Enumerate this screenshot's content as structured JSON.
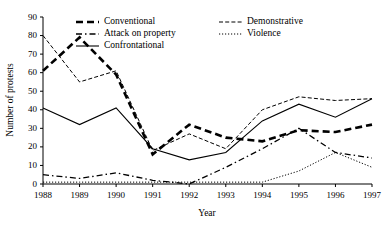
{
  "chart_data": {
    "type": "line",
    "title": "",
    "xlabel": "Year",
    "ylabel": "Number of protests",
    "categories": [
      "1988",
      "1989",
      "1990",
      "1991",
      "1992",
      "1993",
      "1994",
      "1995",
      "1996",
      "1997"
    ],
    "x": [
      1988,
      1989,
      1990,
      1991,
      1992,
      1993,
      1994,
      1995,
      1996,
      1997
    ],
    "xlim": [
      1988,
      1997
    ],
    "ylim": [
      0,
      90
    ],
    "yticks": [
      0,
      10,
      20,
      30,
      40,
      50,
      60,
      70,
      80,
      90
    ],
    "grid": false,
    "legend_position": "top-inside",
    "series": [
      {
        "name": "Conventional",
        "values": [
          61,
          79,
          59,
          16,
          32,
          25,
          23,
          29,
          28,
          32
        ]
      },
      {
        "name": "Attack on property",
        "values": [
          5,
          3,
          6,
          2,
          0,
          9,
          19,
          30,
          17,
          14
        ]
      },
      {
        "name": "Confrontational",
        "values": [
          41,
          32,
          41,
          19,
          13,
          17,
          34,
          43,
          36,
          46
        ]
      },
      {
        "name": "Demonstrative",
        "values": [
          80,
          55,
          61,
          18,
          27,
          19,
          40,
          47,
          45,
          46
        ]
      },
      {
        "name": "Violence",
        "values": [
          1,
          1,
          1,
          1,
          1,
          1,
          1,
          7,
          17,
          9
        ]
      }
    ]
  },
  "legend": {
    "entries": [
      {
        "label": "Conventional"
      },
      {
        "label": "Demonstrative"
      },
      {
        "label": "Attack on property"
      },
      {
        "label": "Violence"
      },
      {
        "label": "Confrontational"
      }
    ]
  }
}
